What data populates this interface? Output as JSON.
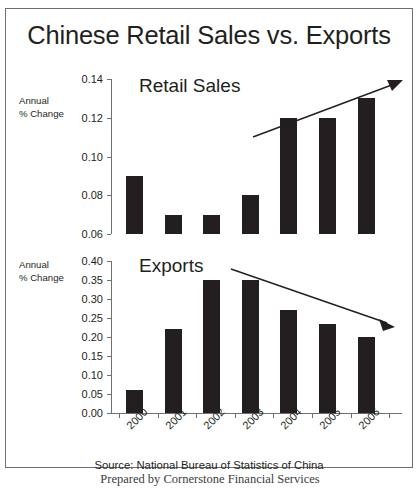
{
  "title": "Chinese Retail Sales vs. Exports",
  "source_note": "Source:  National Bureau of Statistics of China",
  "footer_note": "Prepared by Cornerstone Financial Services",
  "axis_caption": {
    "line1": "Annual",
    "line2": "% Change"
  },
  "chart_data": [
    {
      "type": "bar",
      "title": "Retail Sales",
      "xlabel": "",
      "ylabel": "Annual % Change",
      "categories": [
        "2000",
        "2001",
        "2002",
        "2003",
        "2004",
        "2005",
        "2006"
      ],
      "values": [
        0.09,
        0.07,
        0.07,
        0.08,
        0.12,
        0.12,
        0.13
      ],
      "ylim": [
        0.06,
        0.14
      ],
      "yticks": [
        0.06,
        0.08,
        0.1,
        0.12,
        0.14
      ],
      "ytick_labels": [
        "0.06",
        "0.08",
        "0.10",
        "0.12",
        "0.14"
      ],
      "grid": false,
      "legend": "none",
      "bar_color": "#231f20",
      "annotation": {
        "kind": "arrow",
        "direction": "up",
        "label": ""
      }
    },
    {
      "type": "bar",
      "title": "Exports",
      "xlabel": "",
      "ylabel": "Annual % Change",
      "categories": [
        "2000",
        "2001",
        "2002",
        "2003",
        "2004",
        "2005",
        "2006"
      ],
      "values": [
        0.06,
        0.22,
        0.35,
        0.35,
        0.27,
        0.235,
        0.2
      ],
      "ylim": [
        0.0,
        0.4
      ],
      "yticks": [
        0.0,
        0.05,
        0.1,
        0.15,
        0.2,
        0.25,
        0.3,
        0.35,
        0.4
      ],
      "ytick_labels": [
        "0.00",
        "0.05",
        "0.10",
        "0.15",
        "0.20",
        "0.25",
        "0.30",
        "0.35",
        "0.40"
      ],
      "grid": false,
      "legend": "none",
      "bar_color": "#231f20",
      "annotation": {
        "kind": "arrow",
        "direction": "down",
        "label": ""
      }
    }
  ]
}
